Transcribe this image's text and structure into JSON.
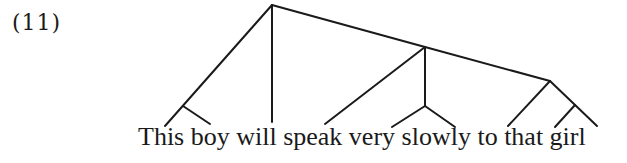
{
  "example_number": "(11)",
  "sentence": "This boy will speak very slowly to that girl",
  "words": [
    "This",
    "boy",
    "will",
    "speak",
    "very",
    "slowly",
    "to",
    "that",
    "girl"
  ],
  "tree": {
    "nodes": {
      "root": [
        272,
        5
      ],
      "np_subject": [
        183,
        106
      ],
      "vp": [
        425,
        47
      ],
      "adv_phrase": [
        425,
        106
      ],
      "pp": [
        550,
        81
      ],
      "np_object": [
        575,
        105
      ]
    },
    "edges": [
      {
        "from": [
          272,
          5
        ],
        "to": [
          165,
          126
        ],
        "target": "This"
      },
      {
        "from": [
          183,
          106
        ],
        "to": [
          210,
          124
        ],
        "target": "boy"
      },
      {
        "from": [
          272,
          5
        ],
        "to": [
          272,
          122
        ],
        "target": "will"
      },
      {
        "from": [
          272,
          5
        ],
        "to": [
          425,
          47
        ],
        "target": "vp"
      },
      {
        "from": [
          425,
          47
        ],
        "to": [
          325,
          124
        ],
        "target": "speak"
      },
      {
        "from": [
          425,
          47
        ],
        "to": [
          425,
          106
        ],
        "target": "adv_phrase"
      },
      {
        "from": [
          425,
          106
        ],
        "to": [
          392,
          127
        ],
        "target": "very"
      },
      {
        "from": [
          425,
          106
        ],
        "to": [
          455,
          127
        ],
        "target": "slowly"
      },
      {
        "from": [
          425,
          47
        ],
        "to": [
          550,
          81
        ],
        "target": "pp"
      },
      {
        "from": [
          550,
          81
        ],
        "to": [
          508,
          126
        ],
        "target": "to"
      },
      {
        "from": [
          550,
          81
        ],
        "to": [
          597,
          126
        ],
        "target": "girl"
      },
      {
        "from": [
          575,
          105
        ],
        "to": [
          555,
          127
        ],
        "target": "that"
      }
    ],
    "line_color": "#1a1a1a"
  }
}
